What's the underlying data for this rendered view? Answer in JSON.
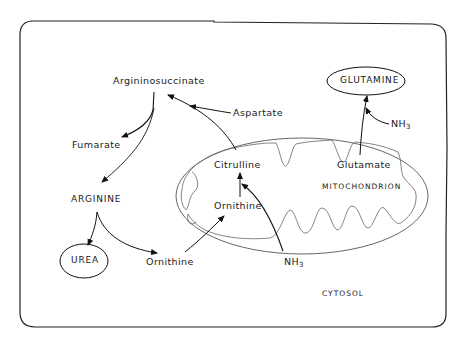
{
  "diagram": {
    "compartments": {
      "mitochondrion_label": "MITOCHONDRION",
      "cytosol_label": "CYTOSOL"
    },
    "nodes": {
      "argininosuccinate": "Argininosuccinate",
      "aspartate": "Aspartate",
      "fumarate": "Fumarate",
      "arginine": "ARGININE",
      "urea": "UREA",
      "ornithine_cytosol": "Ornithine",
      "citrulline": "Citrulline",
      "ornithine_mito": "Ornithine",
      "glutamate": "Glutamate",
      "glutamine": "GLUTAMINE",
      "nh3_main": "NH",
      "nh3_main_sub": "3",
      "nh3_glutamine": "NH",
      "nh3_glutamine_sub": "3"
    },
    "edges": [
      {
        "from": "Ornithine (cytosol)",
        "to": "Ornithine (mitochondrion)"
      },
      {
        "from": "Ornithine (mitochondrion)",
        "to": "Citrulline"
      },
      {
        "from": "NH3",
        "to": "Citrulline"
      },
      {
        "from": "Citrulline",
        "to": "Argininosuccinate"
      },
      {
        "from": "Aspartate",
        "to": "Argininosuccinate"
      },
      {
        "from": "Argininosuccinate",
        "to": "Fumarate"
      },
      {
        "from": "Argininosuccinate",
        "to": "ARGININE"
      },
      {
        "from": "ARGININE",
        "to": "UREA"
      },
      {
        "from": "ARGININE",
        "to": "Ornithine (cytosol)"
      },
      {
        "from": "Glutamate",
        "to": "GLUTAMINE"
      },
      {
        "from": "NH3",
        "to": "GLUTAMINE"
      }
    ]
  }
}
